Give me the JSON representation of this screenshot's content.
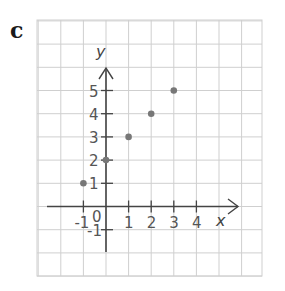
{
  "panel_label": "c",
  "chart_data": {
    "type": "scatter",
    "title": "",
    "xlabel": "x",
    "ylabel": "y",
    "xlim": [
      -1,
      4
    ],
    "ylim": [
      -1,
      5
    ],
    "grid": true,
    "x_ticks": [
      "-1",
      "1",
      "2",
      "3",
      "4"
    ],
    "y_ticks": [
      "5",
      "4",
      "3",
      "2",
      "1",
      "-1"
    ],
    "origin_label": "0",
    "points": [
      {
        "x": -1,
        "y": 1
      },
      {
        "x": 0,
        "y": 2
      },
      {
        "x": 1,
        "y": 3
      },
      {
        "x": 2,
        "y": 4
      },
      {
        "x": 3,
        "y": 5
      }
    ]
  },
  "colors": {
    "grid": "#cfcfcf",
    "axis": "#444444",
    "point": "#777777"
  }
}
